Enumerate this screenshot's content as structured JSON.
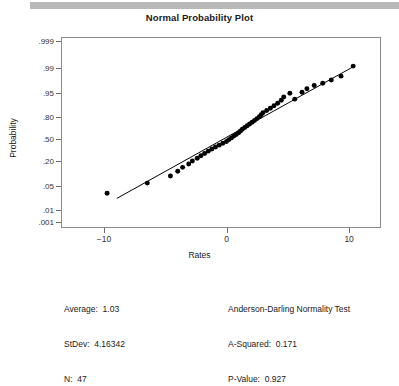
{
  "chart_data": {
    "type": "scatter",
    "title": "Normal Probability Plot",
    "xlabel": "Rates",
    "ylabel": "Probability",
    "grid": false,
    "legend": null,
    "xlim": [
      -13.5,
      12.6
    ],
    "xticks": [
      -10,
      0,
      10
    ],
    "xtick_labels": [
      "−10",
      "0",
      "10"
    ],
    "ytick_labels": [
      ".999",
      ".99",
      ".95",
      ".80",
      ".50",
      ".20",
      ".05",
      ".01",
      ".001"
    ],
    "ytick_values": [
      0.999,
      0.99,
      0.95,
      0.8,
      0.5,
      0.2,
      0.05,
      0.01,
      0.001
    ],
    "ytick_pixels": [
      41,
      68,
      93,
      117,
      139,
      161,
      186,
      210,
      222
    ],
    "point_color": "#000000",
    "line_color": "#000000",
    "frame_color": "#8a8a8a",
    "points": [
      {
        "x": -9.8,
        "p": 0.0165
      },
      {
        "x": -6.5,
        "p": 0.0375
      },
      {
        "x": -4.6,
        "p": 0.062
      },
      {
        "x": -4.0,
        "p": 0.085
      },
      {
        "x": -3.6,
        "p": 0.108
      },
      {
        "x": -3.1,
        "p": 0.131
      },
      {
        "x": -2.8,
        "p": 0.155
      },
      {
        "x": -2.4,
        "p": 0.178
      },
      {
        "x": -2.1,
        "p": 0.202
      },
      {
        "x": -1.8,
        "p": 0.225
      },
      {
        "x": -1.5,
        "p": 0.249
      },
      {
        "x": -1.2,
        "p": 0.272
      },
      {
        "x": -0.9,
        "p": 0.296
      },
      {
        "x": -0.6,
        "p": 0.319
      },
      {
        "x": -0.3,
        "p": 0.343
      },
      {
        "x": 0.0,
        "p": 0.366
      },
      {
        "x": 0.2,
        "p": 0.39
      },
      {
        "x": 0.4,
        "p": 0.413
      },
      {
        "x": 0.6,
        "p": 0.437
      },
      {
        "x": 0.8,
        "p": 0.46
      },
      {
        "x": 1.0,
        "p": 0.484
      },
      {
        "x": 1.15,
        "p": 0.507
      },
      {
        "x": 1.3,
        "p": 0.531
      },
      {
        "x": 1.5,
        "p": 0.554
      },
      {
        "x": 1.7,
        "p": 0.578
      },
      {
        "x": 1.9,
        "p": 0.601
      },
      {
        "x": 2.1,
        "p": 0.625
      },
      {
        "x": 2.3,
        "p": 0.648
      },
      {
        "x": 2.5,
        "p": 0.672
      },
      {
        "x": 2.7,
        "p": 0.695
      },
      {
        "x": 2.85,
        "p": 0.719
      },
      {
        "x": 3.0,
        "p": 0.742
      },
      {
        "x": 3.3,
        "p": 0.766
      },
      {
        "x": 3.6,
        "p": 0.789
      },
      {
        "x": 3.9,
        "p": 0.813
      },
      {
        "x": 4.2,
        "p": 0.836
      },
      {
        "x": 4.5,
        "p": 0.86
      },
      {
        "x": 4.7,
        "p": 0.883
      },
      {
        "x": 5.2,
        "p": 0.907
      },
      {
        "x": 5.6,
        "p": 0.868
      },
      {
        "x": 6.2,
        "p": 0.912
      },
      {
        "x": 6.6,
        "p": 0.93
      },
      {
        "x": 7.2,
        "p": 0.944
      },
      {
        "x": 7.9,
        "p": 0.952
      },
      {
        "x": 8.6,
        "p": 0.962
      },
      {
        "x": 9.4,
        "p": 0.972
      },
      {
        "x": 10.4,
        "p": 0.988
      }
    ],
    "fit_line": {
      "x1": -9.0,
      "p1": 0.0105,
      "x2": 10.5,
      "p2": 0.988
    }
  },
  "stats_left": {
    "average_label": "Average:",
    "average_value": "1.03",
    "stdev_label": "StDev:",
    "stdev_value": "4.16342",
    "n_label": "N:",
    "n_value": "47",
    "line1": "Average:  1.03",
    "line2": "StDev:  4.16342",
    "line3": "N:  47"
  },
  "stats_right": {
    "test_name": "Anderson-Darling Normality Test",
    "a_squared_label": "A-Squared:",
    "a_squared_value": "0.171",
    "p_value_label": "P-Value:",
    "p_value_value": "0.927",
    "line1": "Anderson-Darling Normality Test",
    "line2": "A-Squared:  0.171",
    "line3": "P-Value:  0.927"
  }
}
